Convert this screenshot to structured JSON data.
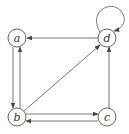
{
  "diagram": {
    "type": "directed-graph",
    "nodes": [
      {
        "id": "a",
        "label": "a",
        "x": 17,
        "y": 38
      },
      {
        "id": "d",
        "label": "d",
        "x": 107,
        "y": 38
      },
      {
        "id": "b",
        "label": "b",
        "x": 17,
        "y": 117
      },
      {
        "id": "c",
        "label": "c",
        "x": 107,
        "y": 117
      }
    ],
    "edges": [
      {
        "from": "d",
        "to": "a"
      },
      {
        "from": "a",
        "to": "b"
      },
      {
        "from": "b",
        "to": "a"
      },
      {
        "from": "b",
        "to": "d"
      },
      {
        "from": "b",
        "to": "c"
      },
      {
        "from": "c",
        "to": "b"
      },
      {
        "from": "c",
        "to": "d"
      },
      {
        "from": "d",
        "to": "d",
        "self_loop": true
      }
    ],
    "colors": {
      "stroke": "#555555",
      "background": "#ffffff"
    }
  }
}
